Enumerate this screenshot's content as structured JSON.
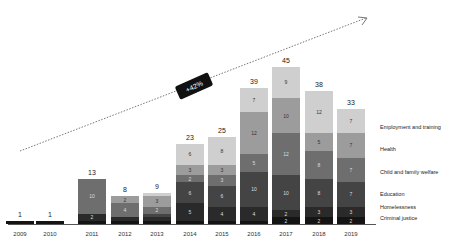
{
  "chart_data": {
    "type": "bar",
    "stacked": true,
    "title": "",
    "xlabel": "",
    "ylabel": "",
    "categories": [
      "2009",
      "2010",
      "2011",
      "2012",
      "2013",
      "2014",
      "2015",
      "2016",
      "2017",
      "2018",
      "2019"
    ],
    "totals": [
      1,
      1,
      13,
      8,
      9,
      23,
      25,
      39,
      45,
      38,
      33
    ],
    "series": [
      {
        "name": "Criminal justice",
        "color": "#141414",
        "values": [
          1,
          1,
          1,
          1,
          1,
          1,
          1,
          1,
          2,
          2,
          2
        ]
      },
      {
        "name": "Homelessness",
        "color": "#2a2a2a",
        "values": [
          0,
          0,
          2,
          1,
          1,
          5,
          4,
          4,
          2,
          3,
          3
        ]
      },
      {
        "name": "Education",
        "color": "#444444",
        "values": [
          0,
          0,
          0,
          0,
          1,
          6,
          6,
          10,
          10,
          8,
          7
        ]
      },
      {
        "name": "Child and family welfare",
        "color": "#6e6e6e",
        "values": [
          0,
          0,
          10,
          4,
          2,
          2,
          3,
          5,
          12,
          8,
          7
        ]
      },
      {
        "name": "Health",
        "color": "#9c9c9c",
        "values": [
          0,
          0,
          0,
          2,
          3,
          3,
          3,
          12,
          10,
          5,
          7
        ]
      },
      {
        "name": "Employment and training",
        "color": "#cfcfcf",
        "values": [
          0,
          0,
          0,
          0,
          1,
          6,
          8,
          7,
          9,
          12,
          7
        ]
      }
    ],
    "ylim": [
      0,
      50
    ],
    "grid": false,
    "legend_position": "right",
    "annotations": [
      {
        "type": "trend-arrow",
        "label": "+42%"
      }
    ]
  },
  "legend": {
    "items": [
      "Employment and training",
      "Health",
      "Child and family welfare",
      "Education",
      "Homelessness",
      "Criminal justice"
    ]
  },
  "trend": {
    "label": "+42%"
  }
}
